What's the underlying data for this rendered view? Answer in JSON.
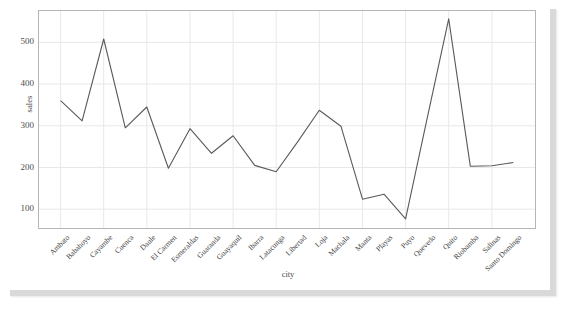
{
  "chart_data": {
    "type": "line",
    "title": "",
    "xlabel": "city",
    "ylabel": "sales",
    "ylim": [
      55,
      575
    ],
    "yticks": [
      100,
      200,
      300,
      400,
      500
    ],
    "grid": true,
    "legend": "none",
    "line_color": "#595959",
    "categories": [
      "Ambato",
      "Babahoyo",
      "Cayambe",
      "Cuenca",
      "Daule",
      "El Carmen",
      "Esmeraldas",
      "Guaranda",
      "Guayaquil",
      "Ibarra",
      "Latacunga",
      "Libertad",
      "Loja",
      "Machala",
      "Manta",
      "Playas",
      "Puyo",
      "Quevedo",
      "Quito",
      "Riobamba",
      "Salinas",
      "Santo Domingo"
    ],
    "values": [
      360,
      312,
      508,
      295,
      345,
      198,
      293,
      234,
      276,
      205,
      190,
      262,
      337,
      299,
      124,
      136,
      77,
      318,
      556,
      203,
      204,
      212
    ]
  },
  "figure": {
    "background": "#ffffff",
    "panel_background": "#ffffff",
    "grid_color": "#e8e8e8",
    "axis_border_color": "#b5b5b5"
  }
}
